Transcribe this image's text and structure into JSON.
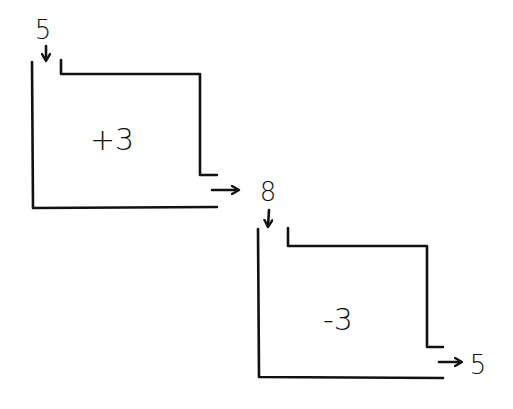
{
  "diagram": {
    "type": "process-flow",
    "style": "hand-drawn",
    "colors": {
      "ink": "#111111",
      "background": "#ffffff"
    },
    "stages": [
      {
        "id": "stage-1",
        "input_value": "5",
        "operation": "+3",
        "output_value": "8"
      },
      {
        "id": "stage-2",
        "input_value": "8",
        "operation": "-3",
        "output_value": "5"
      }
    ],
    "labels": {
      "start_input": "5",
      "box1_operation": "+3",
      "middle_value": "8",
      "box2_operation": "-3",
      "final_output": "5"
    }
  }
}
